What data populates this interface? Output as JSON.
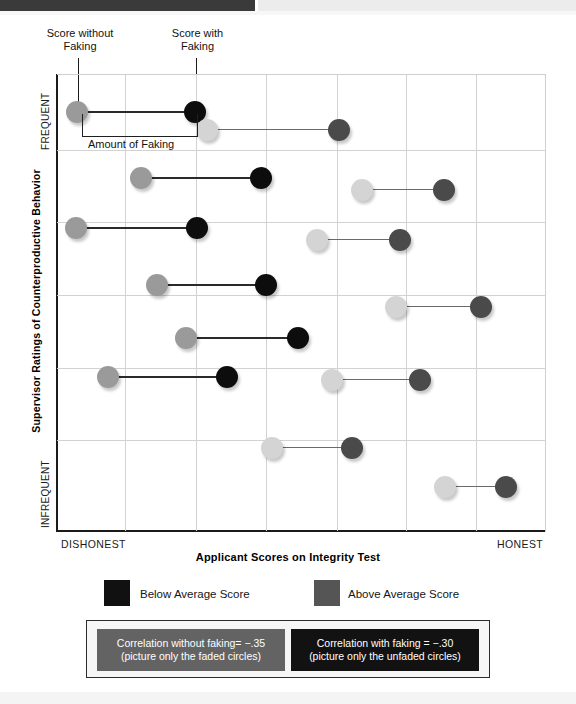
{
  "chart_data": {
    "type": "scatter",
    "title": "",
    "xlabel": "Applicant Scores on Integrity Test",
    "ylabel": "Supervisor Ratings of Counterproductive Behavior",
    "x_tick_labels": [
      "DISHONEST",
      "HONEST"
    ],
    "y_tick_labels": [
      "FREQUENT",
      "INFREQUENT"
    ],
    "grid": true,
    "x_gridlines": 7,
    "y_gridlines": 6,
    "legend_position": "below-axis",
    "series": [
      {
        "name": "Score without Faking",
        "marker": "filled circle (faded)",
        "description": "Applicant's honest / unfaked integrity score"
      },
      {
        "name": "Score with Faking",
        "marker": "filled circle (unfaded)",
        "description": "Applicant's faked integrity score, shifted toward HONEST"
      }
    ],
    "annotations": [
      "Score without Faking",
      "Score with Faking",
      "Amount of Faking"
    ],
    "pairs": [
      {
        "id": 1,
        "group": "below-average",
        "y_px": 112,
        "x_without_px": 77,
        "x_with_px": 195
      },
      {
        "id": 2,
        "group": "above-average",
        "y_px": 130,
        "x_without_px": 207,
        "x_with_px": 339
      },
      {
        "id": 3,
        "group": "below-average",
        "y_px": 178,
        "x_without_px": 141,
        "x_with_px": 261
      },
      {
        "id": 4,
        "group": "above-average",
        "y_px": 190,
        "x_without_px": 362,
        "x_with_px": 444
      },
      {
        "id": 5,
        "group": "below-average",
        "y_px": 228,
        "x_without_px": 76,
        "x_with_px": 197
      },
      {
        "id": 6,
        "group": "above-average",
        "y_px": 240,
        "x_without_px": 317,
        "x_with_px": 400
      },
      {
        "id": 7,
        "group": "below-average",
        "y_px": 285,
        "x_without_px": 157,
        "x_with_px": 266
      },
      {
        "id": 8,
        "group": "above-average",
        "y_px": 307,
        "x_without_px": 396,
        "x_with_px": 481
      },
      {
        "id": 9,
        "group": "below-average",
        "y_px": 338,
        "x_without_px": 186,
        "x_with_px": 298
      },
      {
        "id": 10,
        "group": "above-average",
        "y_px": 380,
        "x_without_px": 332,
        "x_with_px": 420
      },
      {
        "id": 11,
        "group": "below-average",
        "y_px": 377,
        "x_without_px": 108,
        "x_with_px": 227
      },
      {
        "id": 12,
        "group": "above-average",
        "y_px": 448,
        "x_without_px": 272,
        "x_with_px": 352
      },
      {
        "id": 13,
        "group": "above-average",
        "y_px": 487,
        "x_without_px": 445,
        "x_with_px": 506
      }
    ]
  },
  "callouts": {
    "score_without": "Score without\nFaking",
    "score_without_line1": "Score without",
    "score_without_line2": "Faking",
    "score_with_line1": "Score with",
    "score_with_line2": "Faking",
    "amount_of_faking": "Amount of Faking"
  },
  "axes": {
    "y_title": "Supervisor Ratings of Counterproductive Behavior",
    "y_tick_top": "FREQUENT",
    "y_tick_bottom": "INFREQUENT",
    "x_title": "Applicant Scores on Integrity Test",
    "x_tick_left": "DISHONEST",
    "x_tick_right": "HONEST"
  },
  "legend": {
    "items": [
      {
        "label": "Below Average Score",
        "color": "#111111"
      },
      {
        "label": "Above Average Score",
        "color": "#555555"
      }
    ]
  },
  "correlation_box": {
    "without_faking": {
      "line1": "Correlation without faking= −.35",
      "line2": "(picture only the faded circles)",
      "bg": "#636363"
    },
    "with_faking": {
      "line1": "Correlation with faking = −.30",
      "line2": "(picture only the unfaded circles)",
      "bg": "#121212"
    }
  },
  "colors": {
    "dot_below_faded": "#9a9a9a",
    "dot_below_solid": "#0d0d0d",
    "dot_above_faded": "#d4d4d4",
    "dot_above_solid": "#4a4a4a",
    "grid": "#d2d2d2",
    "axis": "#1b1b1b"
  }
}
